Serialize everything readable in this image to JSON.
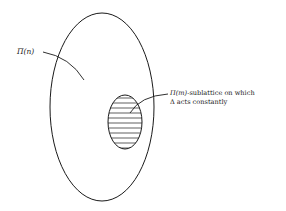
{
  "diagram": {
    "outer_set": {
      "label_symbol": "Π",
      "label_arg": "(n)"
    },
    "inner_set": {
      "label_symbol": "Π",
      "label_arg": "(m)",
      "label_rest_line1": "-sublattice on which",
      "label_line2": "Δ acts constantly",
      "hatched": true
    },
    "colors": {
      "stroke": "#1a1a1a",
      "background": "#ffffff"
    }
  }
}
